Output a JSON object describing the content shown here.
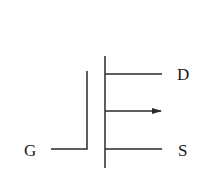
{
  "diagram": {
    "terminals": {
      "drain": "D",
      "source": "S",
      "gate": "G"
    },
    "colors": {
      "stroke": "#2a2a2a",
      "background": "#ffffff"
    }
  }
}
